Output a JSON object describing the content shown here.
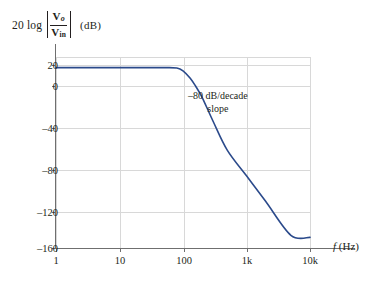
{
  "chart_data": {
    "type": "line",
    "title": "",
    "subtitle": "",
    "ylabel_parts": {
      "lead": "20 log",
      "numerator": "V",
      "numerator_sub": "o",
      "denominator": "V",
      "denominator_sub": "in",
      "units": "(dB)"
    },
    "ylabel": "20 log |Vo/Vin|  (dB)",
    "xlabel": "f (Hz)",
    "xlabel_parts": {
      "symbol": "f",
      "units": "(Hz)"
    },
    "xscale": "log",
    "yscale": "linear",
    "xlim": [
      1,
      10000
    ],
    "ylim": [
      -160,
      20
    ],
    "x_ticks": [
      1,
      10,
      100,
      1000,
      10000
    ],
    "x_tick_labels": [
      "1",
      "10",
      "100",
      "1k",
      "10k"
    ],
    "y_ticks": [
      20,
      0,
      -40,
      -80,
      -120,
      -160
    ],
    "y_tick_labels": [
      "20",
      "0",
      "–40",
      "–80",
      "–120",
      "–160"
    ],
    "grid": true,
    "legend": "none",
    "series": [
      {
        "name": "magnitude-response",
        "color": "#2b4a8b",
        "passband_gain_db": 10,
        "corner_frequency_hz": 100,
        "rolloff_db_per_decade": -80,
        "points": [
          {
            "f": 1,
            "db": 10
          },
          {
            "f": 10,
            "db": 10
          },
          {
            "f": 50,
            "db": 10
          },
          {
            "f": 80,
            "db": 9.6
          },
          {
            "f": 100,
            "db": 7
          },
          {
            "f": 130,
            "db": 0
          },
          {
            "f": 160,
            "db": -8
          },
          {
            "f": 200,
            "db": -18
          },
          {
            "f": 300,
            "db": -41
          },
          {
            "f": 500,
            "db": -68
          },
          {
            "f": 1000,
            "db": -92
          },
          {
            "f": 2000,
            "db": -116
          },
          {
            "f": 5000,
            "db": -148
          },
          {
            "f": 10000,
            "db": -150
          }
        ]
      }
    ],
    "annotations": [
      {
        "name": "slope-annotation",
        "line1": "–80 dB/decade",
        "line2": "slope",
        "at_f": 420,
        "at_db": -28
      }
    ],
    "colors": {
      "curve": "#2b4a8b",
      "grid": "#d8d8d8",
      "axis": "#6f6f6f",
      "text": "#231f20",
      "background": "#ffffff"
    }
  }
}
